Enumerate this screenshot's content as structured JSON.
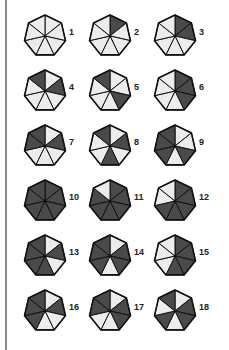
{
  "colors": {
    "shaded": "#4a4a4a",
    "unshaded": "#ececec",
    "stroke": "#111111",
    "rule": "#8a8a8a"
  },
  "segment_order": "clockwise from top vertex: 0=top-right,1=right,2=lower-right,3=bottom,4=lower-left,5=left,6=top-left",
  "heptagons": [
    {
      "label": "1",
      "shaded": []
    },
    {
      "label": "2",
      "shaded": [
        0
      ]
    },
    {
      "label": "3",
      "shaded": [
        0,
        1
      ]
    },
    {
      "label": "4",
      "shaded": [
        6,
        1
      ]
    },
    {
      "label": "5",
      "shaded": [
        6,
        2
      ]
    },
    {
      "label": "6",
      "shaded": [
        0,
        1,
        2
      ]
    },
    {
      "label": "7",
      "shaded": [
        5,
        6,
        1
      ]
    },
    {
      "label": "8",
      "shaded": [
        6,
        1,
        3
      ]
    },
    {
      "label": "9",
      "shaded": [
        4,
        5,
        6,
        2
      ]
    },
    {
      "label": "10",
      "shaded": [
        0,
        1,
        2,
        3,
        4,
        5,
        6
      ]
    },
    {
      "label": "11",
      "shaded": [
        0,
        1,
        2,
        3,
        4,
        5
      ]
    },
    {
      "label": "12",
      "shaded": [
        0,
        1,
        2,
        3,
        4
      ]
    },
    {
      "label": "13",
      "shaded": [
        1,
        3,
        4,
        5,
        6
      ]
    },
    {
      "label": "14",
      "shaded": [
        1,
        2,
        4,
        5,
        6
      ]
    },
    {
      "label": "15",
      "shaded": [
        0,
        1,
        2,
        3
      ]
    },
    {
      "label": "16",
      "shaded": [
        1,
        4,
        5,
        6
      ]
    },
    {
      "label": "17",
      "shaded": [
        1,
        2,
        5,
        6
      ]
    },
    {
      "label": "18",
      "shaded": [
        1,
        2,
        4,
        6
      ]
    }
  ]
}
